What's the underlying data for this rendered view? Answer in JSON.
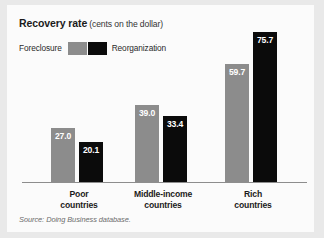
{
  "figure": {
    "background_color": "#e9e9e9",
    "panel_color": "#fbfbfb"
  },
  "title": {
    "main": "Recovery rate",
    "sub": "(cents on the dollar)"
  },
  "legend": {
    "position": "top-left",
    "entries": [
      {
        "label": "Foreclosure",
        "color": "#8c8c8c"
      },
      {
        "label": "Reorganization",
        "color": "#0b0b0b"
      }
    ]
  },
  "source": {
    "prefix": "Source:",
    "publication": "Doing Business",
    "suffix": "database."
  },
  "chart_data": {
    "type": "bar",
    "xlabel": "",
    "ylabel": "cents on the dollar",
    "ylim": [
      0,
      80
    ],
    "grid": false,
    "legend_position": "top-left",
    "categories": [
      "Poor countries",
      "Middle-income countries",
      "Rich countries"
    ],
    "category_lines": [
      [
        "Poor",
        "countries"
      ],
      [
        "Middle-income",
        "countries"
      ],
      [
        "Rich",
        "countries"
      ]
    ],
    "series": [
      {
        "name": "Foreclosure",
        "color": "#8c8c8c",
        "values": [
          27.0,
          39.0,
          59.7
        ],
        "labels": [
          "27.0",
          "39.0",
          "59.7"
        ]
      },
      {
        "name": "Reorganization",
        "color": "#0b0b0b",
        "values": [
          20.1,
          33.4,
          75.7
        ],
        "labels": [
          "20.1",
          "33.4",
          "75.7"
        ]
      }
    ],
    "annotations": [],
    "source_note": "Source: Doing Business database."
  },
  "layout": {
    "baseline_y": 177,
    "pixels_per_unit": 1.985,
    "group_left_x": [
      44,
      128,
      218
    ],
    "bar_width": 24,
    "bar_gap": 4,
    "category_centers": [
      72,
      156,
      246
    ]
  }
}
